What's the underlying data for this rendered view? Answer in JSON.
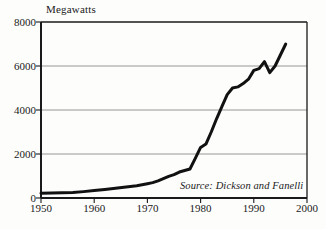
{
  "chart_data": {
    "type": "line",
    "title": "",
    "subtitle": "",
    "xlabel": "",
    "ylabel": "Megawatts",
    "xlim": [
      1950,
      2000
    ],
    "ylim": [
      0,
      8000
    ],
    "grid": true,
    "gridlines_y": [
      2000,
      4000,
      6000,
      8000
    ],
    "legend": null,
    "legend_position": "none",
    "annotations": [
      {
        "name": "source-note",
        "text": "Source: Dickson and Fanelli",
        "x": 1980,
        "y": 450,
        "style": "italic"
      }
    ],
    "xticks": [
      1950,
      1960,
      1970,
      1980,
      1990,
      2000
    ],
    "xtick_labels": [
      "1950",
      "1960",
      "1970",
      "1980",
      "1990",
      "2000"
    ],
    "yticks": [
      0,
      2000,
      4000,
      6000,
      8000
    ],
    "ytick_labels": [
      "0",
      "2000",
      "4000",
      "6000",
      "8000"
    ],
    "series": [
      {
        "name": "Installed geothermal capacity",
        "color": "#111111",
        "line_width": 3,
        "x": [
          1950,
          1952,
          1954,
          1956,
          1958,
          1960,
          1962,
          1964,
          1966,
          1968,
          1970,
          1971,
          1972,
          1973,
          1974,
          1975,
          1976,
          1977,
          1978,
          1979,
          1980,
          1981,
          1982,
          1983,
          1984,
          1985,
          1986,
          1987,
          1988,
          1989,
          1990,
          1991,
          1992,
          1993,
          1994,
          1995,
          1996
        ],
        "values": [
          220,
          230,
          240,
          250,
          290,
          340,
          390,
          440,
          500,
          560,
          650,
          700,
          780,
          880,
          980,
          1060,
          1180,
          1250,
          1320,
          1800,
          2300,
          2450,
          3000,
          3600,
          4150,
          4700,
          5000,
          5050,
          5200,
          5400,
          5800,
          5880,
          6200,
          5700,
          6000,
          6500,
          7000
        ]
      }
    ]
  },
  "geometry": {
    "plot_left": 41,
    "plot_right": 307,
    "plot_top": 22,
    "plot_bottom": 198
  }
}
